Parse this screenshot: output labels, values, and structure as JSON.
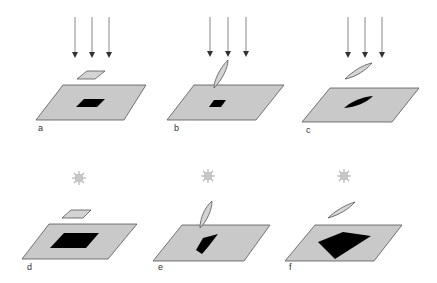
{
  "colors": {
    "plane_fill": "#c9c9c9",
    "plane_stroke": "#555555",
    "shadow_fill": "#000000",
    "object_fill": "#d4d4d4",
    "arrow": "#777777",
    "sun": "#b5b5b5"
  },
  "panels": [
    {
      "id": "a",
      "label": "a",
      "light": "parallel-arrows",
      "object": "horizontal-card"
    },
    {
      "id": "b",
      "label": "b",
      "light": "parallel-arrows",
      "object": "tilted-leaf-touching"
    },
    {
      "id": "c",
      "label": "c",
      "light": "parallel-arrows",
      "object": "tilted-leaf-floating"
    },
    {
      "id": "d",
      "label": "d",
      "light": "point-sun",
      "object": "horizontal-card"
    },
    {
      "id": "e",
      "label": "e",
      "light": "point-sun",
      "object": "tilted-leaf-touching"
    },
    {
      "id": "f",
      "label": "f",
      "light": "point-sun",
      "object": "tilted-leaf-floating"
    }
  ]
}
